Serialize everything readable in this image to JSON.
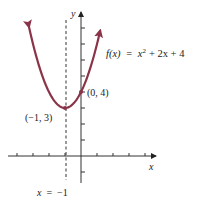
{
  "chart_data": {
    "type": "line",
    "title": "",
    "function_label": "f(x) = x² + 2x + 4",
    "function_parts": {
      "lhs": "f(x)",
      "eq": "=",
      "t1": "x",
      "sup": "2",
      "rest": "+ 2x + 4"
    },
    "xlabel": "x",
    "ylabel": "y",
    "xlim": [
      -4,
      4.5
    ],
    "ylim": [
      -1.5,
      8.7
    ],
    "x_ticks": [
      -4,
      -3,
      -2,
      -1,
      1,
      2,
      3,
      4
    ],
    "y_ticks": [
      -1,
      1,
      2,
      3,
      4,
      5,
      6,
      7,
      8
    ],
    "grid": false,
    "series": [
      {
        "name": "f(x) = x^2 + 2x + 4",
        "x_range": [
          -3.25,
          1.2
        ],
        "color": "#8b3348"
      }
    ],
    "points": [
      {
        "label": "(−1, 3)",
        "x": -1,
        "y": 3
      },
      {
        "label": "(0, 4)",
        "x": 0,
        "y": 4
      }
    ],
    "axis_of_symmetry": {
      "label": "x = −1",
      "x": -1
    }
  },
  "labels": {
    "vertex": "(−1, 3)",
    "yint": "(0, 4)",
    "symmetry": "x = −1",
    "x_axis": "x",
    "y_axis": "y"
  }
}
